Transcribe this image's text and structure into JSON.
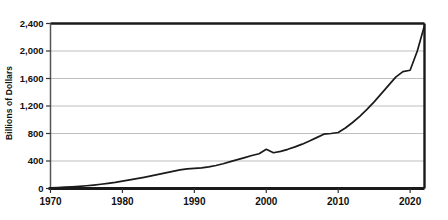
{
  "chart_data": {
    "type": "line",
    "title": "",
    "subtitle": "",
    "xlabel": "",
    "ylabel": "Billions of Dollars",
    "xlim": [
      1970,
      2022
    ],
    "ylim": [
      0,
      2400
    ],
    "xticks": [
      1970,
      1980,
      1990,
      2000,
      2010,
      2020
    ],
    "xticklabels": [
      "1970",
      "1980",
      "1990",
      "2000",
      "2010",
      "2020"
    ],
    "yticks": [
      0,
      400,
      800,
      1200,
      1600,
      2000,
      2400
    ],
    "yticklabels": [
      "0",
      "400",
      "800",
      "1,200",
      "1,600",
      "2,000",
      "2,400"
    ],
    "grid": "horizontal",
    "legend": "none",
    "line_color": "#1a1a1a",
    "grid_color": "#b8b8b8",
    "axis_color": "#1a1a1a",
    "background_color": "#ffffff",
    "series": [
      {
        "name": "Value",
        "x": [
          1970,
          1971,
          1972,
          1973,
          1974,
          1975,
          1976,
          1977,
          1978,
          1979,
          1980,
          1981,
          1982,
          1983,
          1984,
          1985,
          1986,
          1987,
          1988,
          1989,
          1990,
          1991,
          1992,
          1993,
          1994,
          1995,
          1996,
          1997,
          1998,
          1999,
          2000,
          2001,
          2002,
          2003,
          2004,
          2005,
          2006,
          2007,
          2008,
          2009,
          2010,
          2011,
          2012,
          2013,
          2014,
          2015,
          2016,
          2017,
          2018,
          2019,
          2020,
          2021,
          2022
        ],
        "values": [
          10,
          14,
          19,
          25,
          32,
          40,
          50,
          62,
          75,
          90,
          108,
          126,
          144,
          163,
          183,
          205,
          228,
          250,
          270,
          285,
          292,
          300,
          315,
          335,
          360,
          390,
          420,
          450,
          480,
          505,
          570,
          520,
          540,
          570,
          605,
          645,
          690,
          740,
          790,
          800,
          815,
          880,
          960,
          1050,
          1150,
          1260,
          1380,
          1500,
          1620,
          1700,
          1720,
          2000,
          2370
        ]
      }
    ]
  }
}
